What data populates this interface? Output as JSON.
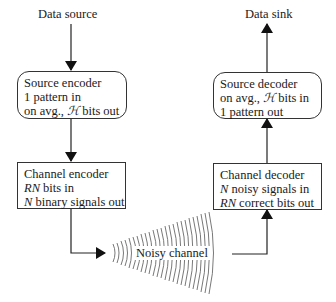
{
  "diagram": {
    "source": {
      "label": "Data source"
    },
    "sink": {
      "label": "Data sink"
    },
    "source_encoder": {
      "title": "Source encoder",
      "line2": "1 pattern in",
      "line3_prefix": "on avg., ",
      "line3_symbol": "ℋ",
      "line3_suffix": " bits out"
    },
    "channel_encoder": {
      "title": "Channel encoder",
      "line2_var": "RN",
      "line2_suffix": " bits in",
      "line3_var": "N",
      "line3_suffix": " binary signals out"
    },
    "channel": {
      "label": "Noisy channel"
    },
    "channel_decoder": {
      "title": "Channel decoder",
      "line2_var": "N",
      "line2_suffix": " noisy signals in",
      "line3_var": "RN",
      "line3_suffix": " correct bits out"
    },
    "source_decoder": {
      "title": "Source decoder",
      "line2_prefix": "on avg., ",
      "line2_symbol": "ℋ",
      "line2_suffix": " bits in",
      "line3": "1 pattern out"
    },
    "colors": {
      "line": "#1a1a1a",
      "arc": "#555555",
      "background": "#ffffff"
    }
  }
}
